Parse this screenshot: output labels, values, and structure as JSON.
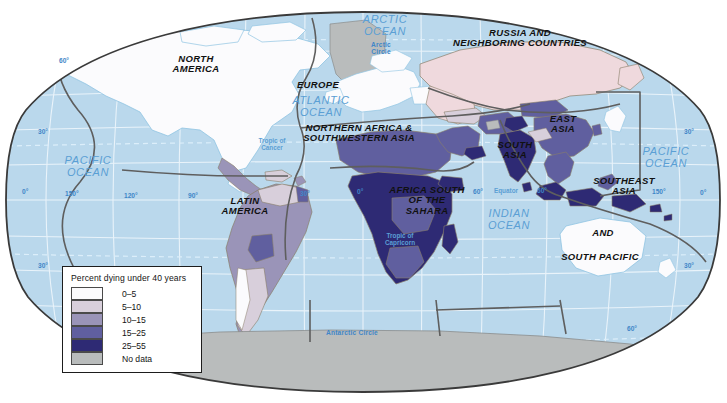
{
  "map": {
    "projection": "oval / Robinson-like world projection",
    "background_color": "#ffffff",
    "ocean_color": "#bad8ec",
    "graticule_color": "#e8f2f9",
    "outline_color": "#3a3a3a",
    "region_border_color": "#595959",
    "country_border_color": "#8a7f6a"
  },
  "legend": {
    "title": "Percent dying under 40 years",
    "items": [
      {
        "label": "0–5",
        "color": "#fbfbfd"
      },
      {
        "label": "5–10",
        "color": "#d8cfdb"
      },
      {
        "label": "10–15",
        "color": "#9a94b8"
      },
      {
        "label": "15–25",
        "color": "#605f9f"
      },
      {
        "label": "25–55",
        "color": "#2e2a74"
      },
      {
        "label": "No data",
        "color": "#b9bcbc"
      }
    ]
  },
  "regions": [
    {
      "name": "north-america",
      "label": "NORTH\nAMERICA",
      "x": 151,
      "y": 54,
      "w": 90
    },
    {
      "name": "latin-america",
      "label": "LATIN\nAMERICA",
      "x": 205,
      "y": 196,
      "w": 80
    },
    {
      "name": "europe",
      "label": "EUROPE",
      "x": 283,
      "y": 80,
      "w": 70
    },
    {
      "name": "north-africa-sw-asia",
      "label": "NORTHERN AFRICA &\nSOUTHWESTERN ASIA",
      "x": 279,
      "y": 123,
      "w": 160
    },
    {
      "name": "africa-south-of-sahara",
      "label": "AFRICA SOUTH\nOF THE\nSAHARA",
      "x": 372,
      "y": 185,
      "w": 110
    },
    {
      "name": "russia-neighbors",
      "label": "RUSSIA AND\nNEIGHBORING COUNTRIES",
      "x": 430,
      "y": 28,
      "w": 180
    },
    {
      "name": "east-asia",
      "label": "EAST\nASIA",
      "x": 533,
      "y": 114,
      "w": 60
    },
    {
      "name": "south-asia",
      "label": "SOUTH\nASIA",
      "x": 486,
      "y": 140,
      "w": 58
    },
    {
      "name": "southeast-asia-south-pacific-1",
      "label": "SOUTHEAST\nASIA",
      "x": 585,
      "y": 176,
      "w": 78
    },
    {
      "name": "southeast-asia-south-pacific-2",
      "label": "AND",
      "x": 583,
      "y": 228,
      "w": 40
    },
    {
      "name": "southeast-asia-south-pacific-3",
      "label": "SOUTH PACIFIC",
      "x": 545,
      "y": 252,
      "w": 110
    }
  ],
  "oceans": [
    {
      "name": "arctic-ocean",
      "label": "ARCTIC\nOCEAN",
      "x": 352,
      "y": 14,
      "w": 66
    },
    {
      "name": "atlantic-ocean",
      "label": "ATLANTIC\nOCEAN",
      "x": 283,
      "y": 95,
      "w": 76
    },
    {
      "name": "pacific-ocean-west",
      "label": "PACIFIC\nOCEAN",
      "x": 52,
      "y": 155,
      "w": 72
    },
    {
      "name": "pacific-ocean-east",
      "label": "PACIFIC\nOCEAN",
      "x": 630,
      "y": 146,
      "w": 72
    },
    {
      "name": "indian-ocean",
      "label": "INDIAN\nOCEAN",
      "x": 477,
      "y": 208,
      "w": 64
    }
  ],
  "reference_lines": [
    {
      "name": "arctic-circle",
      "label": "Arctic\nCircle",
      "x": 361,
      "y": 41,
      "w": 40
    },
    {
      "name": "tropic-of-cancer",
      "label": "Tropic of\nCancer",
      "x": 251,
      "y": 138,
      "w": 42
    },
    {
      "name": "equator",
      "label": "Equator",
      "x": 484,
      "y": 188,
      "w": 44
    },
    {
      "name": "tropic-of-capricorn",
      "label": "Tropic of\nCapricorn",
      "x": 376,
      "y": 233,
      "w": 48
    },
    {
      "name": "antarctic-circle",
      "label": "Antarctic Circle",
      "x": 313,
      "y": 329,
      "w": 78
    }
  ],
  "graticule_labels": [
    {
      "name": "lat-60-nw",
      "label": "60°",
      "x": 59,
      "y": 57
    },
    {
      "name": "lat-30-nw",
      "label": "30°",
      "x": 38,
      "y": 128
    },
    {
      "name": "lon-180-w",
      "label": "0°",
      "x": 22,
      "y": 188
    },
    {
      "name": "lon-150-w",
      "label": "150°",
      "x": 65,
      "y": 190
    },
    {
      "name": "lon-120-w",
      "label": "120°",
      "x": 124,
      "y": 192
    },
    {
      "name": "lon-90-w",
      "label": "90°",
      "x": 188,
      "y": 192
    },
    {
      "name": "lon-30-w",
      "label": "30°",
      "x": 300,
      "y": 190
    },
    {
      "name": "lon-0",
      "label": "0°",
      "x": 357,
      "y": 188
    },
    {
      "name": "lon-60-e",
      "label": "60°",
      "x": 473,
      "y": 188
    },
    {
      "name": "lon-90-e",
      "label": "60°",
      "x": 537,
      "y": 187
    },
    {
      "name": "lon-150-e",
      "label": "150°",
      "x": 652,
      "y": 188
    },
    {
      "name": "lon-180-e",
      "label": "0°",
      "x": 700,
      "y": 189
    },
    {
      "name": "lat-30-ne",
      "label": "30°",
      "x": 684,
      "y": 128
    },
    {
      "name": "lat-30-sw",
      "label": "30°",
      "x": 38,
      "y": 262
    },
    {
      "name": "lat-30-se",
      "label": "30°",
      "x": 684,
      "y": 262
    },
    {
      "name": "lat-60-s",
      "label": "60°",
      "x": 627,
      "y": 325
    }
  ]
}
